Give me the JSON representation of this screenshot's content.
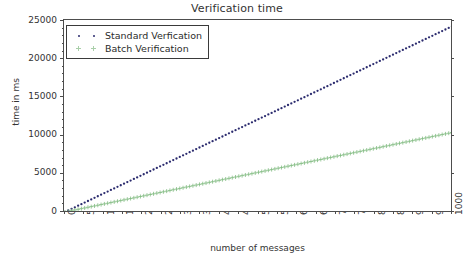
{
  "chart_data": {
    "type": "scatter",
    "title": "Verification time",
    "xlabel": "number of messages",
    "ylabel": "time in ms",
    "xlim": [
      0,
      1000
    ],
    "ylim": [
      0,
      25000
    ],
    "grid": false,
    "legend_position": "upper left",
    "xticks": [
      "0",
      "50",
      "100",
      "150",
      "200",
      "250",
      "300",
      "350",
      "400",
      "450",
      "500",
      "550",
      "600",
      "650",
      "700",
      "750",
      "800",
      "850",
      "900",
      "950",
      "1000"
    ],
    "yticks": [
      "0",
      "5000",
      "10000",
      "15000",
      "20000",
      "25000"
    ],
    "series": [
      {
        "name": "Standard Verfication",
        "marker": "dot",
        "color": "#2b2b6e",
        "x": [
          0,
          50,
          100,
          150,
          200,
          250,
          300,
          350,
          400,
          450,
          500,
          550,
          600,
          650,
          700,
          750,
          800,
          850,
          900,
          950,
          1000
        ],
        "values": [
          0,
          1215,
          2430,
          3645,
          4860,
          6075,
          7290,
          8505,
          9720,
          10935,
          12150,
          13365,
          14580,
          15795,
          17010,
          18225,
          19440,
          20655,
          21870,
          23085,
          24300
        ]
      },
      {
        "name": "Batch Verification",
        "marker": "plus",
        "color": "#7fba7f",
        "x": [
          0,
          50,
          100,
          150,
          200,
          250,
          300,
          350,
          400,
          450,
          500,
          550,
          600,
          650,
          700,
          750,
          800,
          850,
          900,
          950,
          1000
        ],
        "values": [
          0,
          520,
          1040,
          1560,
          2080,
          2600,
          3120,
          3640,
          4160,
          4680,
          5200,
          5720,
          6240,
          6760,
          7280,
          7800,
          8320,
          8840,
          9360,
          9880,
          10400
        ]
      }
    ]
  },
  "legend": {
    "items": [
      {
        "label": "Standard Verfication",
        "marker": "dot",
        "color": "#2b2b6e"
      },
      {
        "label": "Batch Verification",
        "marker": "plus",
        "color": "#a9cfa9"
      }
    ]
  },
  "colors": {
    "standard": "#2b2b6e",
    "batch": "#7fba7f",
    "axis": "#4d4d4d",
    "text": "#333333",
    "background": "#ffffff"
  }
}
